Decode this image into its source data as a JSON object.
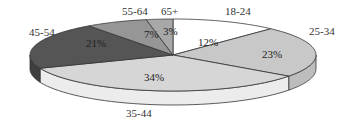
{
  "chart_data": {
    "type": "pie",
    "style": "3d-tilted",
    "title": "",
    "categories": [
      "18-24",
      "25-34",
      "35-44",
      "45-54",
      "55-64",
      "65+"
    ],
    "values": [
      12,
      23,
      34,
      21,
      7,
      3
    ],
    "value_labels": [
      "12%",
      "23%",
      "34%",
      "21%",
      "7%",
      "3%"
    ],
    "colors": [
      "#ffffff",
      "#c8c8c8",
      "#d6d6d6",
      "#555555",
      "#969696",
      "#a8a8a8"
    ],
    "side_colors": [
      "#f0f0f0",
      "#bdbdbd",
      "#ececec",
      "#3f3f3f",
      "#7f7f7f",
      "#909090"
    ],
    "start_angle": "12 o'clock",
    "direction": "clockwise",
    "legend": "none (category labels placed outside slices)"
  },
  "geometry": {
    "cx": 173,
    "cy": 55,
    "rx": 143,
    "ry": 36,
    "depth": 14
  },
  "label_positions": [
    {
      "cat": [
        225,
        15
      ],
      "pct": [
        198,
        46
      ]
    },
    {
      "cat": [
        309,
        35
      ],
      "pct": [
        262,
        58
      ]
    },
    {
      "cat": [
        126,
        117
      ],
      "pct": [
        144,
        81
      ]
    },
    {
      "cat": [
        29,
        36
      ],
      "pct": [
        86,
        47
      ]
    },
    {
      "cat": [
        122,
        15
      ],
      "pct": [
        144,
        38
      ]
    },
    {
      "cat": [
        161,
        15
      ],
      "pct": [
        163,
        35
      ]
    }
  ]
}
